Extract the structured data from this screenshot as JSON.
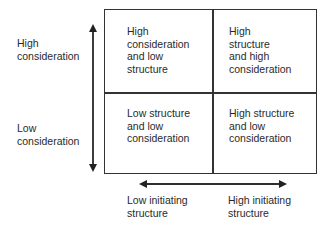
{
  "y_axis": {
    "top_label": "High\nconsideration",
    "bottom_label": "Low\nconsideration"
  },
  "x_axis": {
    "left_label": "Low initiating\nstructure",
    "right_label": "High initiating\nstructure"
  },
  "quadrants": {
    "top_left": "High\nconsideration\nand low\nstructure",
    "top_right": "High\nstructure\nand high\nconsideration",
    "bottom_left": "Low structure\nand low\nconsideration",
    "bottom_right": "High structure\nand low\nconsideration"
  },
  "colors": {
    "line": "#333333",
    "text": "#2a2a2a"
  }
}
